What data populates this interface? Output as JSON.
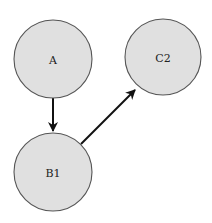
{
  "diagram": {
    "type": "directed-graph",
    "nodes": [
      {
        "id": "A",
        "label": "A",
        "cx": 53,
        "cy": 59,
        "r": 39
      },
      {
        "id": "C2",
        "label": "C2",
        "cx": 163,
        "cy": 57,
        "r": 38
      },
      {
        "id": "B1",
        "label": "B1",
        "cx": 53,
        "cy": 172,
        "r": 39
      }
    ],
    "edges": [
      {
        "from": "A",
        "to": "B1"
      },
      {
        "from": "B1",
        "to": "C2"
      }
    ],
    "colors": {
      "node_fill": "#e0e0e0",
      "node_stroke": "#555555",
      "edge": "#111111",
      "background": "#ffffff"
    }
  }
}
